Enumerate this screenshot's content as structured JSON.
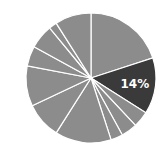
{
  "chart_data": {
    "type": "pie",
    "title": "",
    "categories": [
      "S1",
      "S2",
      "S3",
      "S4",
      "S5",
      "S6",
      "S7",
      "S8",
      "S9",
      "S10",
      "S11",
      "S12"
    ],
    "values": [
      20,
      14,
      4,
      4,
      3,
      14,
      9,
      10,
      5,
      6,
      2,
      9
    ],
    "highlight_index": 1,
    "labels": [
      {
        "index": 1,
        "text": "14%"
      }
    ],
    "start_angle_deg": 0,
    "direction": "clockwise",
    "legend": "none",
    "colors": {
      "default": "#8c8c8c",
      "highlight": "#3a3a3a",
      "separator": "#ffffff",
      "label_text": "#ffffff"
    }
  },
  "geometry": {
    "cx": 91,
    "cy": 78,
    "r": 65
  }
}
